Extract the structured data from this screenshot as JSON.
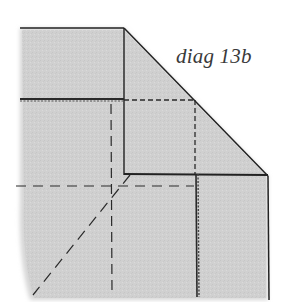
{
  "diagram": {
    "label": "diag 13b",
    "colors": {
      "paper": "#d2d2d2",
      "paper_edge": "#e6e6e6",
      "line": "#1e1e1e",
      "dash": "#2a2a2a",
      "background": "#ffffff"
    },
    "elements": [
      {
        "name": "folded-flap",
        "kind": "polygon",
        "desc": "upper folded layer with diagonal edge"
      },
      {
        "name": "stitch-line-horizontal",
        "kind": "stitched-line"
      },
      {
        "name": "stitch-line-vertical",
        "kind": "stitched-line"
      },
      {
        "name": "fold-guide-horizontal",
        "kind": "dashed-line"
      },
      {
        "name": "fold-guide-vertical-left",
        "kind": "dashed-line"
      },
      {
        "name": "fold-guide-vertical-right",
        "kind": "dashed-line"
      },
      {
        "name": "fold-guide-diagonal",
        "kind": "dashed-line"
      }
    ]
  }
}
